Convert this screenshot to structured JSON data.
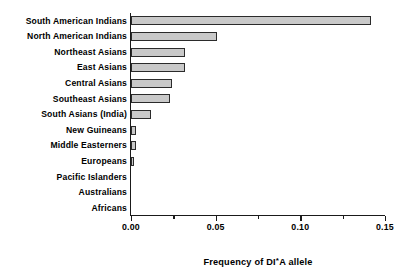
{
  "chart_data": {
    "type": "bar",
    "orientation": "horizontal",
    "title": "",
    "xlabel": "Frequency of DI*A allele",
    "ylabel": "",
    "xlim": [
      0.0,
      0.15
    ],
    "xticks": [
      "0.00",
      "0.05",
      "0.10",
      "0.15"
    ],
    "xtick_values": [
      0.0,
      0.05,
      0.1,
      0.15
    ],
    "minor_tick_values": [
      0.025,
      0.075,
      0.125
    ],
    "grid": false,
    "legend": false,
    "bar_fill_color": "#c9c9c9",
    "bar_edge_color": "#2b2b2b",
    "categories": [
      "South American Indians",
      "North American Indians",
      "Northeast Asians",
      "East Asians",
      "Central Asians",
      "Southeast Asians",
      "South Asians (India)",
      "New Guineans",
      "Middle Easterners",
      "Europeans",
      "Pacific Islanders",
      "Australians",
      "Africans"
    ],
    "values": [
      0.142,
      0.051,
      0.032,
      0.032,
      0.024,
      0.023,
      0.012,
      0.003,
      0.003,
      0.002,
      0.0,
      0.0,
      0.0
    ]
  },
  "axis_title_parts": {
    "before": "Frequency of DI",
    "star": "*",
    "after": "A allele"
  }
}
